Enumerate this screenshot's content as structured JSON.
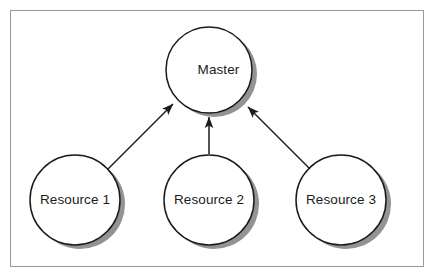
{
  "diagram": {
    "frame": {
      "border_color": "#9a9a9a",
      "background_color": "#ffffff"
    },
    "style": {
      "node_fill": "#ffffff",
      "node_stroke": "#1b1b1b",
      "shadow_color": "#808080",
      "arrow_color": "#1b1b1b",
      "text_color": "#1b1b1b"
    },
    "nodes": [
      {
        "id": "master",
        "label": "Master",
        "cx": 209,
        "cy": 70,
        "r": 43
      },
      {
        "id": "resource1",
        "label": "Resource 1",
        "cx": 75,
        "cy": 200,
        "r": 45
      },
      {
        "id": "resource2",
        "label": "Resource 2",
        "cx": 209,
        "cy": 200,
        "r": 45
      },
      {
        "id": "resource3",
        "label": "Resource 3",
        "cx": 341,
        "cy": 200,
        "r": 45
      }
    ],
    "edges": [
      {
        "id": "edge-resource1-master",
        "from": "resource1",
        "to": "master",
        "direction": "to-master",
        "arrowhead": "end"
      },
      {
        "id": "edge-resource2-master",
        "from": "resource2",
        "to": "master",
        "direction": "to-master",
        "arrowhead": "end"
      },
      {
        "id": "edge-resource3-master",
        "from": "resource3",
        "to": "master",
        "direction": "to-master",
        "arrowhead": "end"
      }
    ]
  }
}
